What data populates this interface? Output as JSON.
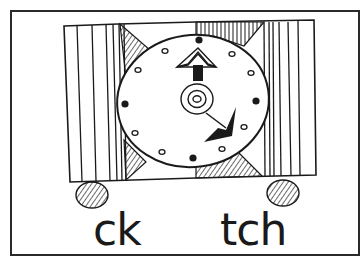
{
  "card": {
    "labels": {
      "left": "ck",
      "right": "tch"
    }
  },
  "illustration": {
    "subject": "clock",
    "hands": {
      "hour": "12",
      "minute": "4"
    }
  },
  "colors": {
    "ink": "#1a1a1a",
    "paper": "#ffffff"
  }
}
